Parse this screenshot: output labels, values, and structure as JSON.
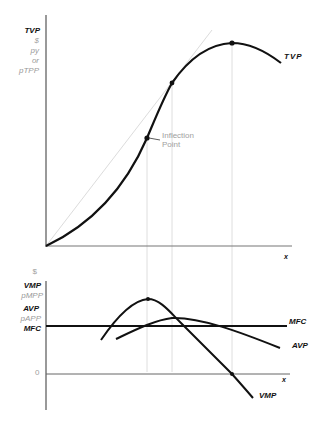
{
  "top_panel": {
    "y_axis_labels": [
      "TVP",
      "$",
      "py",
      "or",
      "pTPP"
    ],
    "x_axis_label": "x",
    "curve_label": "TVP",
    "annotation": [
      "Inflection",
      "Point"
    ]
  },
  "bottom_panel": {
    "y_axis_labels": [
      "$",
      "VMP",
      "pMPP",
      "AVP",
      "pAPP",
      "MFC"
    ],
    "zero_label": "0",
    "x_axis_label": "x",
    "curve_labels": {
      "mfc": "MFC",
      "avp": "AVP",
      "vmp": "VMP"
    }
  },
  "colors": {
    "curve": "#111111",
    "axis": "#555555",
    "guide": "#d8d8d8",
    "ray": "#dddddd",
    "muted_text": "#9a9a9a"
  }
}
